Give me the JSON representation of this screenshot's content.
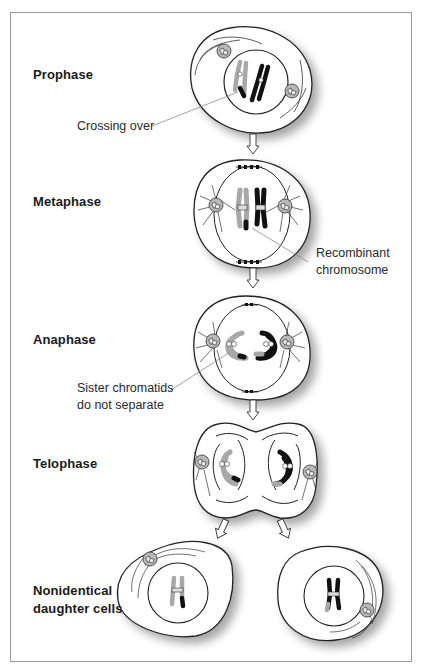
{
  "figure": {
    "stages": [
      {
        "id": "prophase",
        "label": "Prophase"
      },
      {
        "id": "metaphase",
        "label": "Metaphase"
      },
      {
        "id": "anaphase",
        "label": "Anaphase"
      },
      {
        "id": "telophase",
        "label": "Telophase"
      },
      {
        "id": "daughters",
        "label_line1": "Nonidentical",
        "label_line2": "daughter cells"
      }
    ],
    "callouts": {
      "crossing_over": "Crossing over",
      "recombinant_line1": "Recombinant",
      "recombinant_line2": "chromosome",
      "sister_line1": "Sister chromatids",
      "sister_line2": "do not separate"
    },
    "colors": {
      "frame": "#9a9a9a",
      "outline": "#2b2b2b",
      "light_chromosome": "#a8a8a8",
      "dark_chromosome": "#111111",
      "centrosome": "#b5b5b5",
      "leader_line": "#8a8a8a"
    }
  }
}
